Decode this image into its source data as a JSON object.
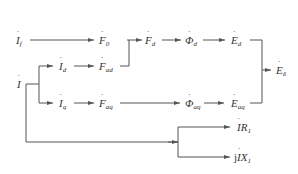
{
  "diagram": {
    "title": "",
    "line_color": "#555555",
    "nodes": {
      "If": {
        "base": "I",
        "sub": "f",
        "x": 17,
        "y": 35
      },
      "I": {
        "base": "I",
        "sub": "",
        "x": 17,
        "y": 79
      },
      "Id": {
        "base": "I",
        "sub": "d",
        "x": 59,
        "y": 60
      },
      "Iq": {
        "base": "I",
        "sub": "q",
        "x": 59,
        "y": 98
      },
      "F0": {
        "base": "F",
        "sub": "0",
        "x": 100,
        "y": 35
      },
      "Fad": {
        "base": "F",
        "sub": "ad",
        "x": 100,
        "y": 60
      },
      "Faq": {
        "base": "F",
        "sub": "aq",
        "x": 100,
        "y": 98
      },
      "Fd": {
        "base": "F",
        "sub": "d",
        "x": 146,
        "y": 35
      },
      "Phid": {
        "base": "Φ",
        "sub": "d",
        "x": 186,
        "y": 35
      },
      "Phiaq": {
        "base": "Φ",
        "sub": "aq",
        "x": 186,
        "y": 98
      },
      "Ed": {
        "base": "E",
        "sub": "d",
        "x": 231,
        "y": 35
      },
      "Eaq": {
        "base": "E",
        "sub": "aq",
        "x": 231,
        "y": 98
      },
      "Edelta": {
        "base": "E",
        "sub": "δ",
        "x": 276,
        "y": 64
      },
      "IR1": {
        "pre": "",
        "base": "I",
        "post": "R",
        "sub": "1",
        "x": 237,
        "y": 122
      },
      "jIX1": {
        "pre": "j",
        "base": "I",
        "post": "X",
        "sub": "1",
        "x": 234,
        "y": 152
      }
    },
    "edges": [
      {
        "from": "If",
        "to": "F0"
      },
      {
        "from": "I",
        "to": "Id"
      },
      {
        "from": "I",
        "to": "Iq"
      },
      {
        "from": "Id",
        "to": "Fad"
      },
      {
        "from": "Iq",
        "to": "Faq"
      },
      {
        "from": "F0",
        "to": "Fd"
      },
      {
        "from": "Fad",
        "to": "Fd"
      },
      {
        "from": "Fd",
        "to": "Phid"
      },
      {
        "from": "Phid",
        "to": "Ed"
      },
      {
        "from": "Faq",
        "to": "Phiaq"
      },
      {
        "from": "Phiaq",
        "to": "Eaq"
      },
      {
        "from": "Ed",
        "to": "Edelta"
      },
      {
        "from": "Eaq",
        "to": "Edelta"
      },
      {
        "from": "I",
        "to": "IR1"
      },
      {
        "from": "I",
        "to": "jIX1"
      }
    ]
  }
}
